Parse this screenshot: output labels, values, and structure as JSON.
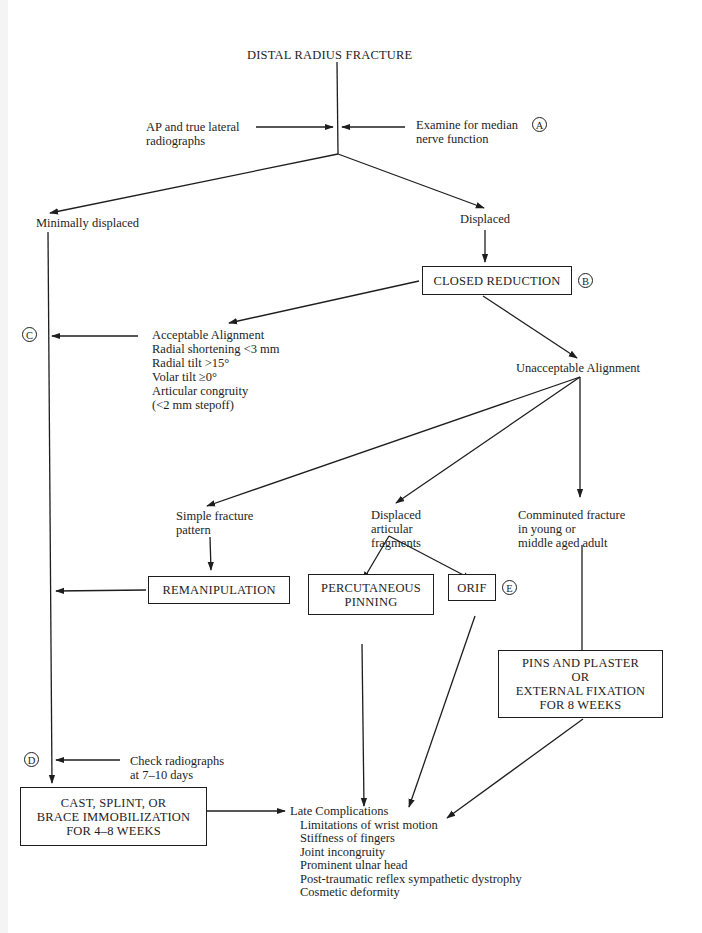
{
  "title": "DISTAL RADIUS FRACTURE",
  "step_inputs": {
    "left": [
      "AP and true lateral",
      "radiographs"
    ],
    "right": [
      "Examine for median",
      "nerve function"
    ],
    "right_marker": "A"
  },
  "branches": {
    "minimal": "Minimally displaced",
    "displaced": "Displaced"
  },
  "closed_reduction": {
    "label": "CLOSED REDUCTION",
    "marker": "B"
  },
  "acceptable": {
    "heading": "Acceptable Alignment",
    "criteria": [
      "Radial shortening <3 mm",
      "Radial tilt >15°",
      "Volar tilt ≥0°",
      "Articular congruity",
      "(<2 mm stepoff)"
    ],
    "marker": "C"
  },
  "unacceptable": "Unacceptable Alignment",
  "patterns": {
    "simple": [
      "Simple fracture",
      "pattern"
    ],
    "articular": [
      "Displaced",
      "articular",
      "fragments"
    ],
    "comminuted": [
      "Comminuted fracture",
      "in young or",
      "middle aged adult"
    ]
  },
  "treatments": {
    "remanipulation": "REMANIPULATION",
    "percutaneous": [
      "PERCUTANEOUS",
      "PINNING"
    ],
    "orif": "ORIF",
    "orif_marker": "E",
    "pins": [
      "PINS AND PLASTER",
      "OR",
      "EXTERNAL FIXATION",
      "FOR 8 WEEKS"
    ]
  },
  "check": {
    "lines": [
      "Check radiographs",
      "at 7–10 days"
    ],
    "marker": "D"
  },
  "immobilization": [
    "CAST, SPLINT, OR",
    "BRACE IMMOBILIZATION",
    "FOR 4–8 WEEKS"
  ],
  "late_complications": {
    "heading": "Late Complications",
    "items": [
      "Limitations of wrist motion",
      "Stiffness of fingers",
      "Joint incongruity",
      "Prominent ulnar head",
      "Post-traumatic reflex sympathetic dystrophy",
      "Cosmetic deformity"
    ]
  }
}
